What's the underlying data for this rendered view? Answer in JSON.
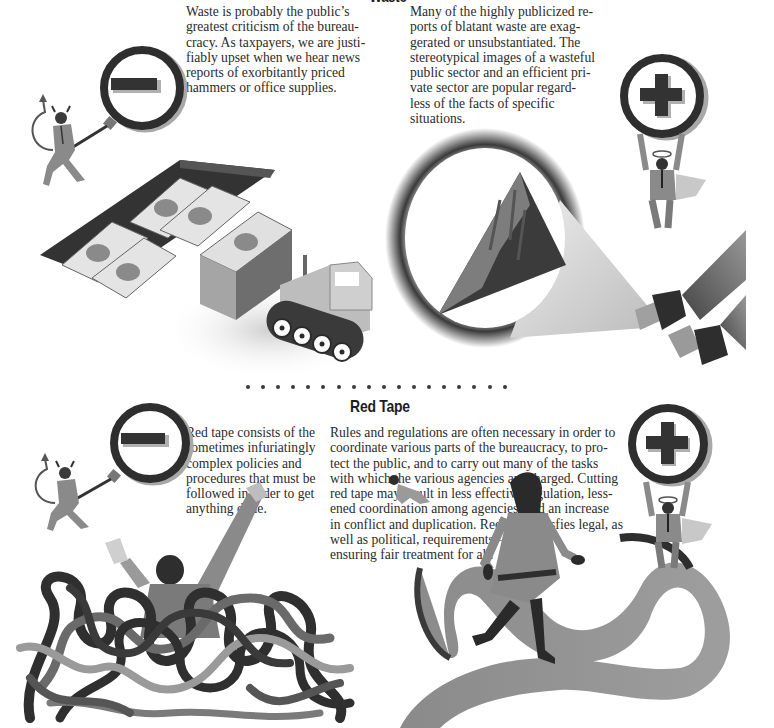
{
  "page": {
    "background": "#ffffff",
    "text_color": "#2b2b2b"
  },
  "waste": {
    "heading": "Waste",
    "con_text": "Waste is probably the public’s\ngreatest criticism of the bureau-\ncracy. As taxpayers, we are justi-\nfiably upset when we hear news\nreports of exorbitantly priced\nhammers or office supplies.",
    "pro_text": "Many of the highly publicized re-\nports of blatant waste are exag-\ngerated or unsubstantiated. The\nstereotypical images of a wasteful\npublic sector and an efficient pri-\nvate sector are popular regard-\nless of the facts of specific\nsituations.",
    "con_icon": "minus-sign-icon",
    "pro_icon": "plus-sign-icon",
    "con_figure": "devil-figure",
    "pro_figure": "angel-figure",
    "con_illustration": "money-bulldozer-illustration",
    "pro_illustration": "flashlight-mountain-illustration"
  },
  "separator": {
    "dot_count": 18,
    "color": "#3a3a3a"
  },
  "red_tape": {
    "heading": "Red Tape",
    "con_text": "Red tape consists of the\nsometimes infuriatingly\ncomplex policies and\nprocedures that must be\nfollowed in order to get\nanything done.",
    "pro_text": "Rules and regulations are often necessary in order to\ncoordinate various parts of the bureaucracy, to pro-\ntect the public, and to carry out many of the tasks\nwith which the various agencies are charged. Cutting\nred tape may result in less effective regulation, less-\nened coordination among agencies, and an increase\nin conflict and duplication. Red tape satisfies legal, as\nwell as political, requirements—\nensuring fair treatment for all.",
    "con_icon": "minus-sign-icon",
    "pro_icon": "plus-sign-icon",
    "con_figure": "devil-figure",
    "pro_figure": "angel-figure",
    "con_illustration": "tangled-tape-drowning-man-illustration",
    "pro_illustration": "woman-walking-ribbon-path-illustration"
  },
  "colors": {
    "ink_dark": "#2e2e2e",
    "mid_gray": "#7a7a7a",
    "light_gray": "#a8a8a8",
    "pale_gray": "#d6d6d6"
  }
}
